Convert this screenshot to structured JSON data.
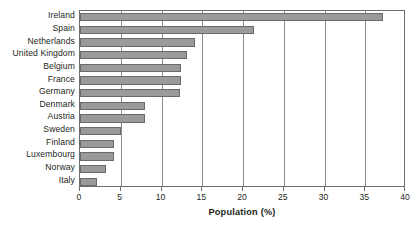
{
  "chart_data": {
    "type": "bar",
    "orientation": "horizontal",
    "title": "",
    "xlabel": "Population (%)",
    "ylabel": "",
    "xlim": [
      0,
      40
    ],
    "xticks": [
      0,
      5,
      10,
      15,
      20,
      25,
      30,
      35,
      40
    ],
    "grid": true,
    "legend": null,
    "categories": [
      "Ireland",
      "Spain",
      "Netherlands",
      "United Kingdom",
      "Belgium",
      "France",
      "Germany",
      "Denmark",
      "Austria",
      "Sweden",
      "Finland",
      "Luxembourg",
      "Norway",
      "Italy"
    ],
    "values": [
      37.2,
      21.3,
      14.1,
      13.1,
      12.4,
      12.4,
      12.3,
      8.0,
      8.0,
      5.0,
      4.2,
      4.2,
      3.2,
      2.1
    ],
    "colors": {
      "bar_fill": "#9a9a9a",
      "bar_edge": "#6a6a6a",
      "gridline": "#8c8c8c",
      "axis": "#6e6e6e",
      "text": "#231f20",
      "background": "#ffffff"
    }
  }
}
